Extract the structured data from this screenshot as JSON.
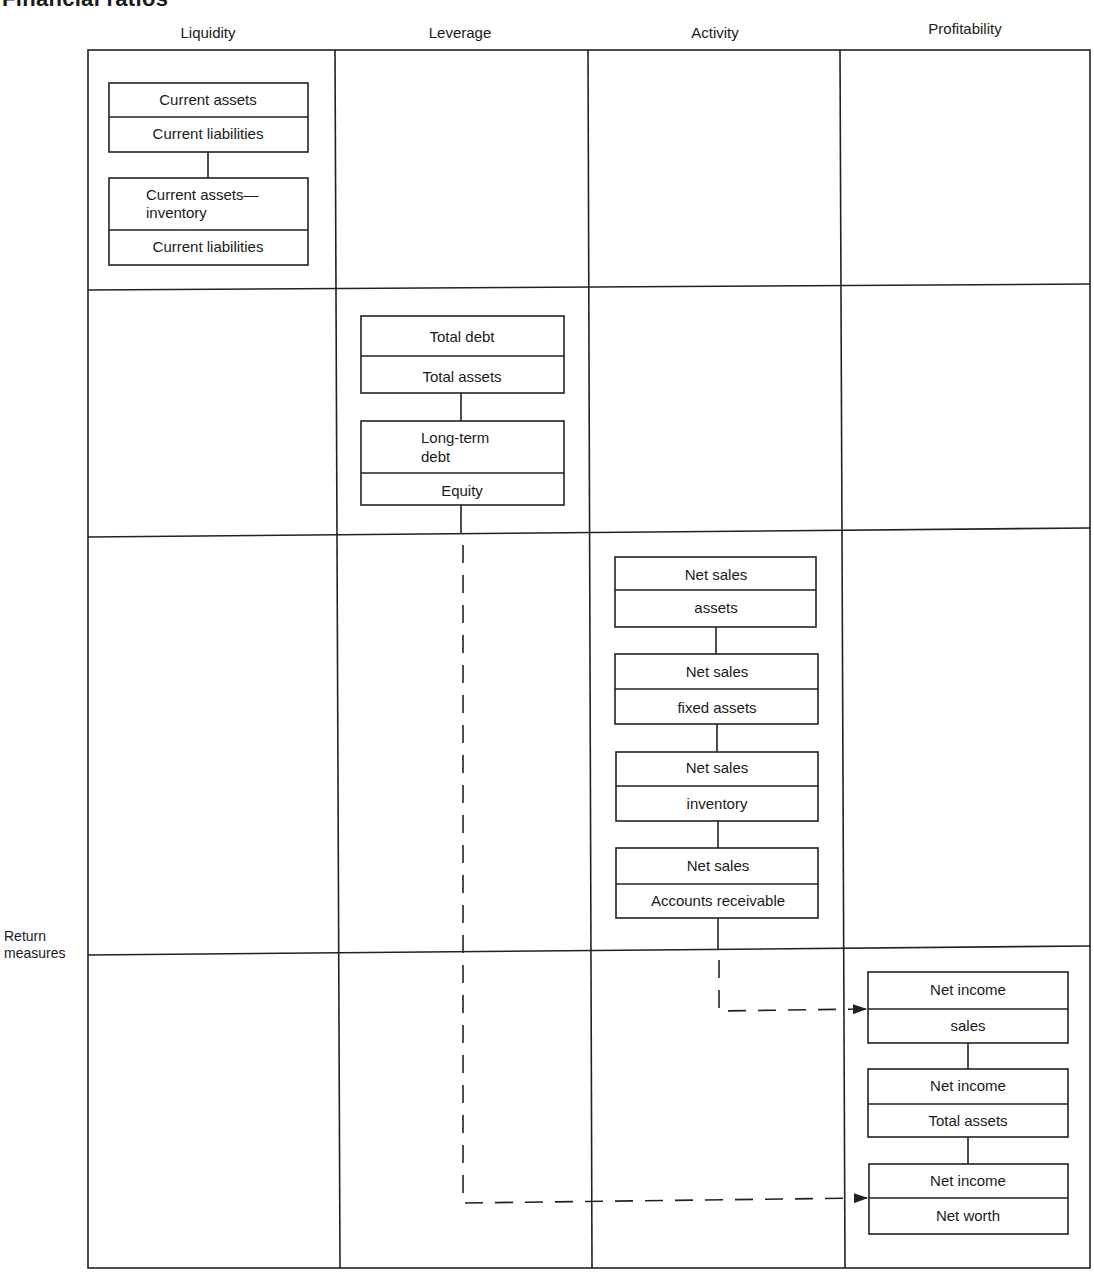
{
  "title": "Financial ratios",
  "columns": [
    "Liquidity",
    "Leverage",
    "Activity",
    "Profitability"
  ],
  "row_label": "Return measures",
  "colors": {
    "line": "#222222",
    "background": "#ffffff",
    "text": "#1a1a1a"
  },
  "ratios": {
    "liquidity": [
      {
        "numerator": "Current assets",
        "denominator": "Current liabilities"
      },
      {
        "numerator_line1": "Current assets—",
        "numerator_line2": "inventory",
        "denominator": "Current liabilities"
      }
    ],
    "leverage": [
      {
        "numerator": "Total debt",
        "denominator": "Total assets"
      },
      {
        "numerator_line1": "Long-term",
        "numerator_line2": "debt",
        "denominator": "Equity"
      }
    ],
    "activity": [
      {
        "numerator": "Net sales",
        "denominator": "assets"
      },
      {
        "numerator": "Net sales",
        "denominator": "fixed assets"
      },
      {
        "numerator": "Net sales",
        "denominator": "inventory"
      },
      {
        "numerator": "Net sales",
        "denominator": "Accounts receivable"
      }
    ],
    "profitability": [
      {
        "numerator": "Net income",
        "denominator": "sales"
      },
      {
        "numerator": "Net income",
        "denominator": "Total assets"
      },
      {
        "numerator": "Net income",
        "denominator": "Net worth"
      }
    ]
  },
  "connections": [
    {
      "from": "activity",
      "to": "profitability.0",
      "style": "dashed-arrow"
    },
    {
      "from": "leverage",
      "to": "profitability.2",
      "style": "dashed-arrow"
    }
  ]
}
